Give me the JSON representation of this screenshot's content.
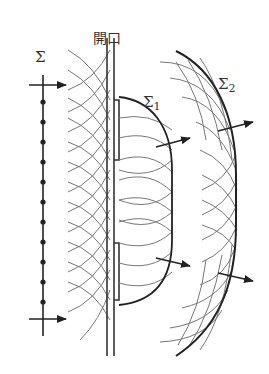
{
  "diagram": {
    "type": "huygens-diffraction",
    "colors": {
      "stroke_main": "#222222",
      "stroke_wave": "#666666",
      "background": "#ffffff"
    },
    "labels": {
      "incident_wavefront": "Σ",
      "aperture": "開口",
      "wavefront_1_base": "Σ",
      "wavefront_1_sub": "1",
      "wavefront_2_base": "Σ",
      "wavefront_2_sub": "2"
    },
    "incident_wavefront": {
      "x": 43,
      "y_top": 75,
      "y_bottom": 336,
      "secondary_source_dots_y": [
        102,
        122,
        142,
        162,
        182,
        202,
        222,
        242,
        262,
        282,
        302
      ],
      "arrows_y": [
        85,
        319
      ]
    },
    "screen": {
      "left_x": 107,
      "right_x": 114,
      "y_top": 38,
      "y_bottom": 356,
      "aperture_y_top": 160,
      "aperture_y_bottom": 243
    }
  }
}
